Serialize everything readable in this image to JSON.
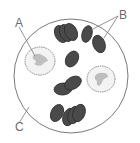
{
  "diagram": {
    "type": "blood-smear-microscope-view",
    "labels": {
      "A": "A",
      "B": "B",
      "C": "C"
    },
    "components": [
      {
        "label": "A",
        "description": "white blood cell (with lobed nucleus)"
      },
      {
        "label": "B",
        "description": "red blood cells"
      },
      {
        "label": "C",
        "description": "plasma"
      }
    ],
    "colors": {
      "outline": "#7a7a7a",
      "red_cell_fill": "#4a4a4a",
      "red_cell_edge": "#2e2e2e",
      "white_cell_fill": "#f2f2f2",
      "nucleus_fill": "#bdbdbd",
      "label_text": "#6a6a6a"
    }
  }
}
